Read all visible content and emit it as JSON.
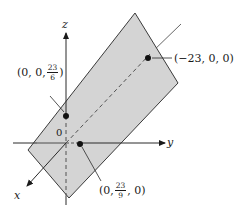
{
  "diagram": {
    "type": "3d-plane-intercepts",
    "colors": {
      "plane_fill": "#d4d4d4",
      "plane_edge": "#3a3a3a",
      "axis": "#2a2a2a",
      "axis_hidden": "#777777",
      "point": "#111111",
      "background": "#ffffff"
    },
    "axes": {
      "x_label": "x",
      "y_label": "y",
      "z_label": "z",
      "origin_label": "0"
    },
    "points": [
      {
        "id": "z-intercept",
        "prefix": "(0, 0, ",
        "frac_num": "23",
        "frac_den": "6",
        "suffix": ")"
      },
      {
        "id": "x-intercept",
        "text": "(−23, 0, 0)"
      },
      {
        "id": "y-intercept",
        "prefix": "(0, ",
        "frac_num": "23",
        "frac_den": "9",
        "suffix": ", 0)"
      }
    ]
  }
}
